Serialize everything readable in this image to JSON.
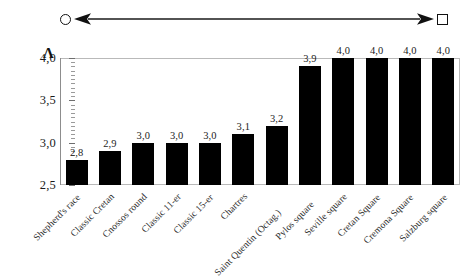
{
  "spectrum": {
    "left_endpoint_icon": "circle-outline",
    "right_endpoint_icon": "square-outline",
    "arrow_icon": "double-headed-arrow"
  },
  "axis": {
    "y_symbol": "Λ",
    "y_tick_labels": [
      "4,0",
      "3,5",
      "3,0",
      "2,5"
    ]
  },
  "chart_data": {
    "type": "bar",
    "title": "",
    "xlabel": "",
    "ylabel": "Λ",
    "ylim": [
      2.5,
      4.0
    ],
    "ytick_values": [
      4.0,
      3.5,
      3.0,
      2.5
    ],
    "ytick_labels": [
      "4,0",
      "3,5",
      "3,0",
      "2,5"
    ],
    "grid": false,
    "legend": null,
    "decimal_separator": ",",
    "bar_color": "#000000",
    "categories": [
      "Shepherd's race",
      "Classic Cretan",
      "Cnossos round",
      "Classic 11-er",
      "Classic 15-er",
      "Chartres",
      "Saint Quentin (Octag.)",
      "Pylos square",
      "Seville square",
      "Cretan Square",
      "Cremona Square",
      "Salzburg square"
    ],
    "values": [
      2.8,
      2.9,
      3.0,
      3.0,
      3.0,
      3.1,
      3.2,
      3.9,
      4.0,
      4.0,
      4.0,
      4.0
    ],
    "value_labels": [
      "2,8",
      "2,9",
      "3,0",
      "3,0",
      "3,0",
      "3,1",
      "3,2",
      "3,9",
      "4,0",
      "4,0",
      "4,0",
      "4,0"
    ]
  }
}
